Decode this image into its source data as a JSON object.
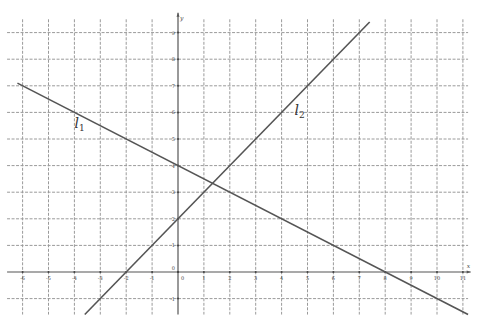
{
  "chart_data": {
    "type": "line",
    "title": "",
    "xlabel": "x",
    "ylabel": "y",
    "xlim": [
      -6,
      11
    ],
    "ylim": [
      -1,
      9
    ],
    "grid": true,
    "x_ticks": [
      -6,
      -5,
      -4,
      -3,
      -2,
      -1,
      0,
      1,
      2,
      3,
      4,
      5,
      6,
      7,
      8,
      9,
      10,
      11
    ],
    "y_ticks": [
      -1,
      0,
      1,
      2,
      3,
      4,
      5,
      6,
      7,
      8,
      9
    ],
    "series": [
      {
        "name": "l1",
        "label": "l",
        "subscript": "1",
        "equation": "y = -x/2 + 4",
        "slope": -0.5,
        "intercept": 4,
        "x": [
          -6.2,
          0,
          8,
          11.2
        ],
        "y": [
          7.1,
          4,
          0,
          -1.6
        ],
        "label_pos": [
          -4,
          5.4
        ]
      },
      {
        "name": "l2",
        "label": "l",
        "subscript": "2",
        "equation": "y = x + 2",
        "slope": 1,
        "intercept": 2,
        "x": [
          -3.6,
          -2,
          0,
          4,
          6,
          7.4
        ],
        "y": [
          -1.6,
          0,
          2,
          6,
          8,
          9.4
        ],
        "label_pos": [
          4.5,
          5.9
        ]
      }
    ],
    "intersection": [
      1.33,
      3.33
    ]
  },
  "axes": {
    "x_name": "x",
    "y_name": "y",
    "origin_label": "0"
  }
}
